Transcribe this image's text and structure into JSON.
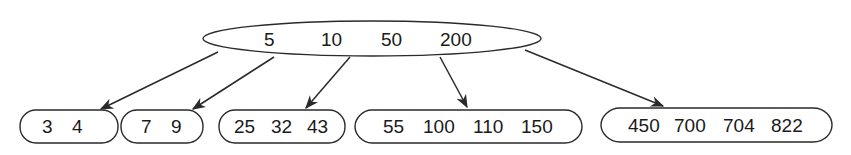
{
  "diagram": {
    "type": "B-tree",
    "root": {
      "keys": [
        "5",
        "10",
        "50",
        "200"
      ]
    },
    "leaves": [
      {
        "keys": [
          "3",
          "4"
        ],
        "label": "3   4"
      },
      {
        "keys": [
          "7",
          "9"
        ],
        "label": "7   9"
      },
      {
        "keys": [
          "25",
          "32",
          "43"
        ],
        "label": "25  32  43"
      },
      {
        "keys": [
          "55",
          "100",
          "110",
          "150"
        ],
        "label": "55  100  110  150"
      },
      {
        "keys": [
          "450",
          "700",
          "704",
          "822"
        ],
        "label": "450  700  704  822"
      }
    ],
    "colors": {
      "stroke": "#2a2a2a",
      "text": "#1a1a1a",
      "background": "#ffffff"
    }
  }
}
